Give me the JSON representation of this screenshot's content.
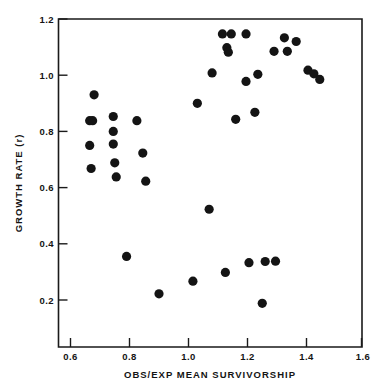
{
  "chart_data": {
    "type": "scatter",
    "title": "",
    "xlabel": "OBS/EXP  MEAN  SURVIVORSHIP",
    "ylabel": "GROWTH  RATE  (r)",
    "xlim": [
      0.555,
      1.6
    ],
    "ylim": [
      0.1,
      1.2
    ],
    "grid": false,
    "legend": null,
    "xticks": [
      0.6,
      0.8,
      1.0,
      1.2,
      1.4,
      1.6
    ],
    "xticklabels": [
      "0.6",
      "0.8",
      "1.0",
      "1.2",
      "1.4",
      "1.6"
    ],
    "yticks": [
      0.2,
      0.4,
      0.6,
      0.8,
      1.0,
      1.2
    ],
    "yticklabels": [
      "0.2",
      "0.4",
      "0.6",
      "0.8",
      "1.0",
      "1.2"
    ],
    "marker": "filled-circle",
    "marker_color": "#141414",
    "marker_size": 4.6,
    "n_points": 40,
    "x": [
      0.68,
      0.665,
      0.675,
      0.745,
      0.665,
      0.745,
      0.67,
      0.745,
      0.825,
      0.75,
      0.755,
      0.79,
      0.845,
      0.855,
      0.9,
      1.015,
      1.03,
      1.07,
      1.08,
      1.115,
      1.125,
      1.13,
      1.135,
      1.145,
      1.16,
      1.195,
      1.195,
      1.205,
      1.225,
      1.235,
      1.25,
      1.26,
      1.29,
      1.295,
      1.325,
      1.335,
      1.365,
      1.405,
      1.425,
      1.445
    ],
    "y": [
      0.93,
      0.838,
      0.838,
      0.853,
      0.75,
      0.8,
      0.668,
      0.755,
      0.838,
      0.688,
      0.638,
      0.355,
      0.723,
      0.623,
      0.222,
      0.267,
      0.9,
      0.523,
      1.008,
      1.147,
      0.298,
      1.098,
      1.082,
      1.147,
      0.843,
      0.978,
      1.147,
      0.333,
      0.868,
      1.003,
      0.188,
      0.337,
      1.085,
      0.338,
      1.133,
      1.085,
      1.12,
      1.018,
      1.005,
      0.985
    ]
  },
  "axes": {
    "y_title": "GROWTH  RATE  (r)",
    "x_title": "OBS/EXP  MEAN  SURVIVORSHIP",
    "x_tick_labels": [
      "0.6",
      "0.8",
      "1.0",
      "1.2",
      "1.4",
      "1.6"
    ],
    "y_tick_labels": [
      "1.2",
      "1.0",
      "0.8",
      "0.6",
      "0.4",
      "0.2"
    ]
  },
  "colors": {
    "ink": "#141414",
    "background": "#ffffff",
    "marker": "#141414"
  }
}
